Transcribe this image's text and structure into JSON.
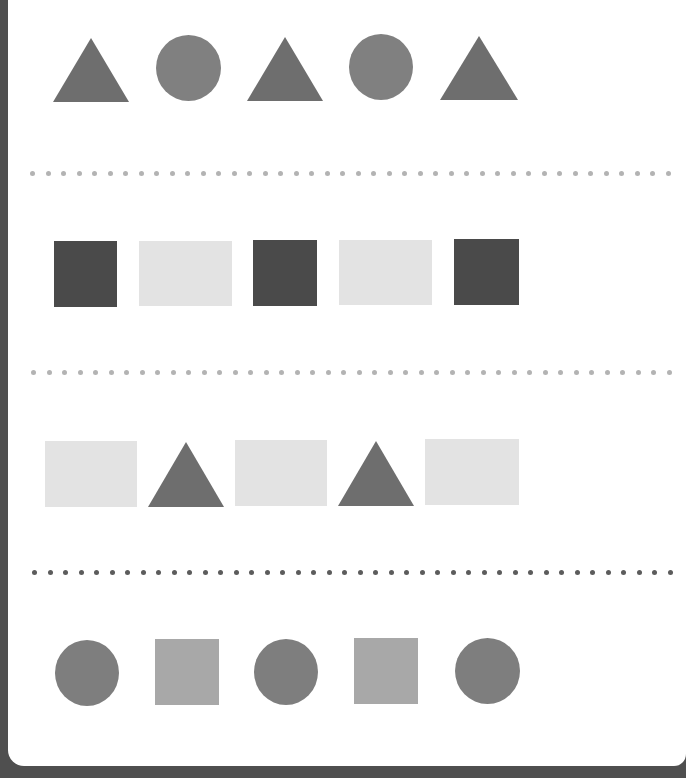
{
  "worksheet": {
    "title": "",
    "colors": {
      "frame": "#4f4f4f",
      "paper": "#ffffff",
      "triangle": "#6e6e6e",
      "circle_row1": "#808080",
      "dark_square": "#4a4a4a",
      "light_rect": "#e3e3e3",
      "circle_row4": "#7e7e7e",
      "mid_square": "#a8a8a8",
      "dots_light": "#b3b3b3",
      "dots_dark": "#5c5c5c"
    },
    "rows": [
      {
        "name": "row-1",
        "pattern": [
          "triangle",
          "circle",
          "triangle",
          "circle",
          "triangle"
        ],
        "shapes": [
          {
            "type": "triangle",
            "x": 45,
            "y": 38,
            "w": 77,
            "h": 64,
            "color": "#6e6e6e"
          },
          {
            "type": "circle",
            "x": 148,
            "y": 35,
            "w": 65,
            "h": 66,
            "color": "#808080"
          },
          {
            "type": "triangle",
            "x": 239,
            "y": 37,
            "w": 76,
            "h": 64,
            "color": "#6e6e6e"
          },
          {
            "type": "circle",
            "x": 341,
            "y": 34,
            "w": 64,
            "h": 66,
            "color": "#808080"
          },
          {
            "type": "triangle",
            "x": 432,
            "y": 36,
            "w": 78,
            "h": 64,
            "color": "#6e6e6e"
          }
        ]
      },
      {
        "name": "row-2",
        "pattern": [
          "dark-square",
          "light-rectangle",
          "dark-square",
          "light-rectangle",
          "dark-square"
        ],
        "shapes": [
          {
            "type": "rect",
            "x": 46,
            "y": 241,
            "w": 63,
            "h": 66,
            "color": "#4a4a4a"
          },
          {
            "type": "rect",
            "x": 131,
            "y": 241,
            "w": 93,
            "h": 65,
            "color": "#e3e3e3"
          },
          {
            "type": "rect",
            "x": 245,
            "y": 240,
            "w": 64,
            "h": 66,
            "color": "#4a4a4a"
          },
          {
            "type": "rect",
            "x": 331,
            "y": 240,
            "w": 93,
            "h": 65,
            "color": "#e3e3e3"
          },
          {
            "type": "rect",
            "x": 446,
            "y": 239,
            "w": 65,
            "h": 66,
            "color": "#4a4a4a"
          }
        ]
      },
      {
        "name": "row-3",
        "pattern": [
          "light-rectangle",
          "triangle",
          "light-rectangle",
          "triangle",
          "light-rectangle"
        ],
        "shapes": [
          {
            "type": "rect",
            "x": 37,
            "y": 441,
            "w": 92,
            "h": 66,
            "color": "#e3e3e3"
          },
          {
            "type": "triangle",
            "x": 140,
            "y": 442,
            "w": 77,
            "h": 65,
            "color": "#6e6e6e"
          },
          {
            "type": "rect",
            "x": 227,
            "y": 440,
            "w": 92,
            "h": 66,
            "color": "#e3e3e3"
          },
          {
            "type": "triangle",
            "x": 330,
            "y": 441,
            "w": 76,
            "h": 65,
            "color": "#6e6e6e"
          },
          {
            "type": "rect",
            "x": 417,
            "y": 439,
            "w": 94,
            "h": 66,
            "color": "#e3e3e3"
          }
        ]
      },
      {
        "name": "row-4",
        "pattern": [
          "circle",
          "square",
          "circle",
          "square",
          "circle"
        ],
        "shapes": [
          {
            "type": "circle",
            "x": 47,
            "y": 640,
            "w": 64,
            "h": 66,
            "color": "#7e7e7e"
          },
          {
            "type": "rect",
            "x": 147,
            "y": 639,
            "w": 64,
            "h": 66,
            "color": "#a8a8a8"
          },
          {
            "type": "circle",
            "x": 246,
            "y": 639,
            "w": 64,
            "h": 66,
            "color": "#7e7e7e"
          },
          {
            "type": "rect",
            "x": 346,
            "y": 638,
            "w": 64,
            "h": 66,
            "color": "#a8a8a8"
          },
          {
            "type": "circle",
            "x": 447,
            "y": 638,
            "w": 65,
            "h": 66,
            "color": "#7e7e7e"
          }
        ]
      }
    ],
    "separators": [
      {
        "name": "dotted-divider-1",
        "y": 171,
        "start_x": 22,
        "spacing": 15.5,
        "count": 42,
        "color": "#b3b3b3"
      },
      {
        "name": "dotted-divider-2",
        "y": 370,
        "start_x": 23,
        "spacing": 15.5,
        "count": 42,
        "color": "#b3b3b3"
      },
      {
        "name": "dotted-divider-3",
        "y": 570,
        "start_x": 24,
        "spacing": 15.5,
        "count": 42,
        "color": "#5c5c5c"
      }
    ]
  }
}
